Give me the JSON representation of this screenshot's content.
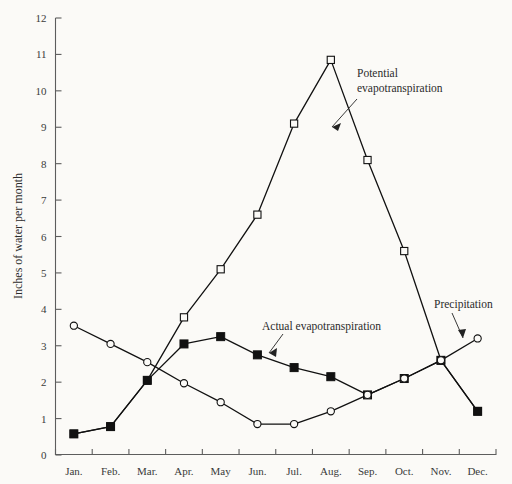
{
  "chart_data": {
    "type": "line",
    "title": "",
    "xlabel": "",
    "ylabel": "Inches of water per month",
    "categories": [
      "Jan.",
      "Feb.",
      "Mar.",
      "Apr.",
      "May",
      "Jun.",
      "Jul.",
      "Aug.",
      "Sep.",
      "Oct.",
      "Nov.",
      "Dec."
    ],
    "ylim": [
      0,
      12
    ],
    "yticks": [
      0,
      1,
      2,
      3,
      4,
      5,
      6,
      7,
      8,
      9,
      10,
      11,
      12
    ],
    "grid": false,
    "legend_position": "inline-annotations",
    "series": [
      {
        "name": "Potential evapotranspiration",
        "marker": "open-square",
        "values": [
          0.58,
          0.78,
          2.05,
          3.78,
          5.1,
          6.6,
          9.1,
          10.85,
          8.1,
          5.6,
          2.6,
          1.2
        ]
      },
      {
        "name": "Actual evapotranspiration",
        "marker": "filled-square",
        "values": [
          0.58,
          0.78,
          2.05,
          3.05,
          3.25,
          2.75,
          2.4,
          2.15,
          1.65,
          2.1,
          2.6,
          1.2
        ]
      },
      {
        "name": "Precipitation",
        "marker": "open-circle",
        "values": [
          3.55,
          3.05,
          2.55,
          1.97,
          1.45,
          0.85,
          0.85,
          1.2,
          1.65,
          2.1,
          2.6,
          3.2
        ]
      }
    ],
    "annotations": [
      {
        "text": "Potential evapotranspiration",
        "for": "Potential evapotranspiration"
      },
      {
        "text": "Actual evapotranspiration",
        "for": "Actual evapotranspiration"
      },
      {
        "text": "Precipitation",
        "for": "Precipitation"
      }
    ]
  },
  "colors": {
    "background": "#fbfaf7",
    "axis": "#5d5d5d",
    "line": "#111111",
    "text": "#2b2b2b"
  }
}
